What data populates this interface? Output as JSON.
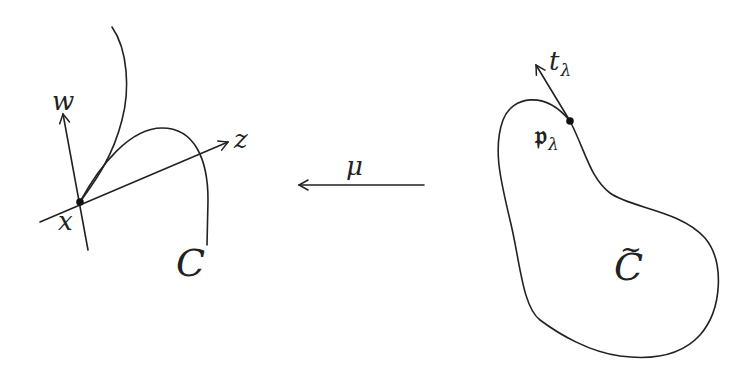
{
  "diagram": {
    "left_figure": {
      "curve_label": "C",
      "point_label": "x",
      "axis_vertical_label": "w",
      "axis_horizontal_label": "z"
    },
    "map": {
      "label": "μ",
      "direction": "right-to-left"
    },
    "right_figure": {
      "curve_label": "C",
      "curve_label_accent": "~",
      "point_label": "𝔭",
      "point_label_subscript": "λ",
      "tangent_label": "t",
      "tangent_label_subscript": "λ"
    },
    "colors": {
      "ink": "#222222",
      "background": "#ffffff"
    }
  }
}
